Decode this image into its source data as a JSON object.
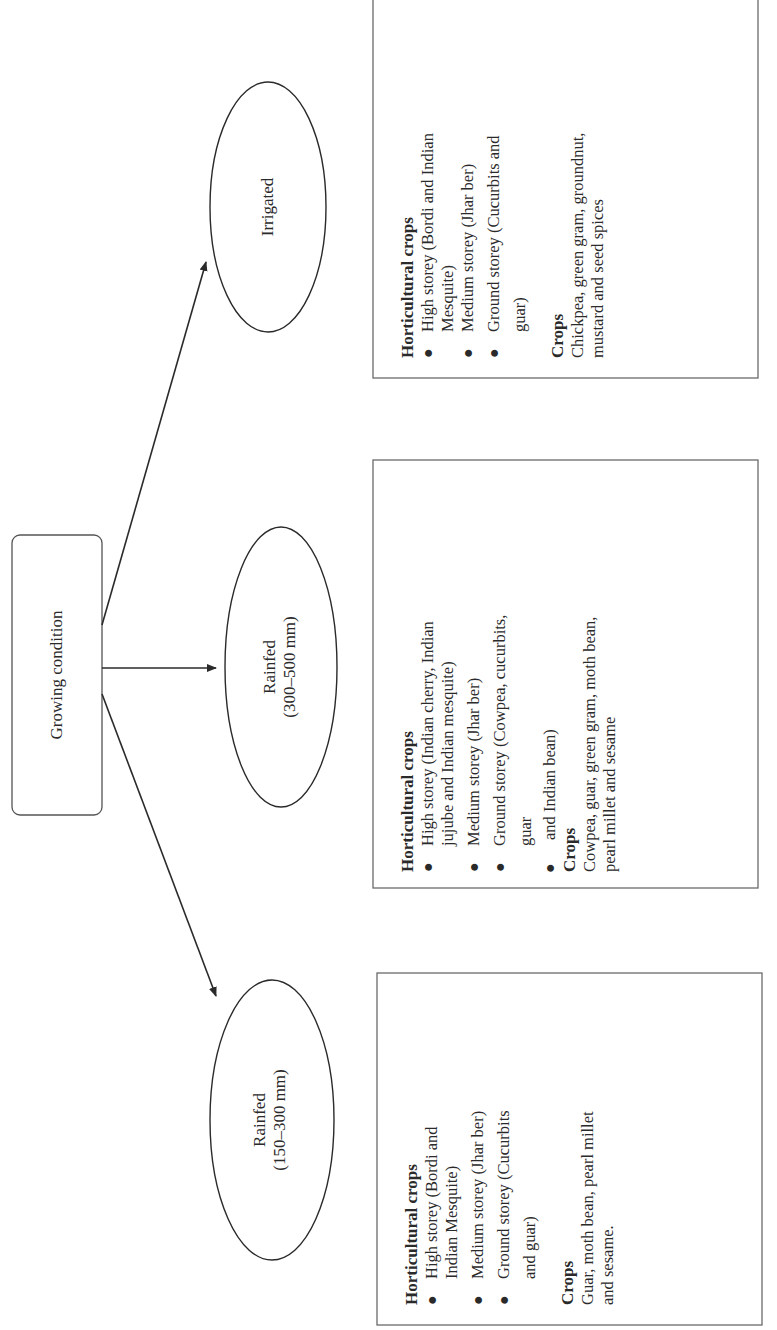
{
  "root": {
    "label": "Growing condition"
  },
  "branches": [
    {
      "node_line1": "Irrigated",
      "node_line2": "",
      "box": {
        "hort_heading": "Horticultural crops",
        "hort_items": [
          "High storey (Bordi and Indian",
          "Mesquite)",
          "Medium storey (Jhar ber)",
          "Ground storey (Cucurbits and",
          "guar)"
        ],
        "crops_heading": "Crops",
        "crops_lines": [
          "Chickpea, green gram, groundnut,",
          "mustard and seed spices"
        ]
      }
    },
    {
      "node_line1": "Rainfed",
      "node_line2": "(300–500 mm)",
      "box": {
        "hort_heading": "Horticultural crops",
        "hort_items": [
          "High storey (Indian cherry, Indian",
          "jujube and Indian mesquite)",
          "Medium storey (Jhar ber)",
          "Ground storey (Cowpea, cucurbits,",
          "guar",
          "and Indian bean)"
        ],
        "crops_heading": "Crops",
        "crops_lines": [
          "Cowpea, guar, green gram, moth bean,",
          "pearl millet and sesame"
        ]
      }
    },
    {
      "node_line1": "Rainfed",
      "node_line2": "(150–300 mm)",
      "box": {
        "hort_heading": "Horticultural crops",
        "hort_items": [
          "High storey (Bordi and",
          "Indian Mesquite)",
          "Medium storey (Jhar ber)",
          "Ground storey (Cucurbits",
          "and guar)"
        ],
        "crops_heading": "Crops",
        "crops_lines": [
          "Guar, moth bean, pearl millet",
          "and sesame."
        ]
      }
    }
  ],
  "bullet_glyph": "●",
  "colors": {
    "stroke": "#2a2a2a",
    "box_border": "#6a6a6a",
    "background": "#ffffff"
  }
}
